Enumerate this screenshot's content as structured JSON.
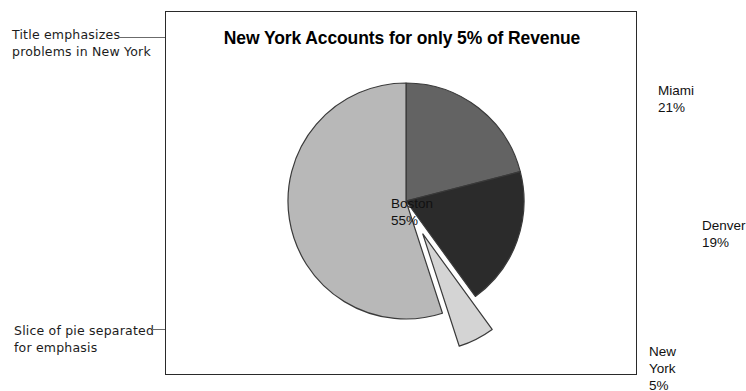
{
  "figure": {
    "frame_border_color": "#2a2a2a",
    "background": "#ffffff"
  },
  "annotations": [
    {
      "name": "title-annotation",
      "text": "Title emphasizes\nproblems in New York"
    },
    {
      "name": "slice-annotation",
      "text": "Slice of pie separated\nfor emphasis"
    }
  ],
  "chart_data": {
    "type": "pie",
    "title": "New York Accounts for only 5% of Revenue",
    "xlabel": "",
    "ylabel": "",
    "legend_position": "none",
    "grid": false,
    "start_angle_deg": 0,
    "direction": "clockwise",
    "categories": [
      "Miami",
      "Denver",
      "New York",
      "Boston"
    ],
    "values": [
      21,
      19,
      5,
      55
    ],
    "unit": "%",
    "labels": [
      {
        "name": "Miami",
        "text": "Miami\n21%",
        "value": 21,
        "color": "#636363",
        "exploded": false
      },
      {
        "name": "Denver",
        "text": "Denver\n19%",
        "value": 19,
        "color": "#2b2b2b",
        "exploded": false
      },
      {
        "name": "New York",
        "text": "New York\n5%",
        "value": 5,
        "color": "#d4d4d4",
        "exploded": true
      },
      {
        "name": "Boston",
        "text": "Boston\n55%",
        "value": 55,
        "color": "#b8b8b8",
        "exploded": false
      }
    ],
    "colors": {
      "miami": "#636363",
      "denver": "#2b2b2b",
      "newyork": "#d4d4d4",
      "boston": "#b8b8b8",
      "slice_outline": "#3a3a3a"
    }
  }
}
